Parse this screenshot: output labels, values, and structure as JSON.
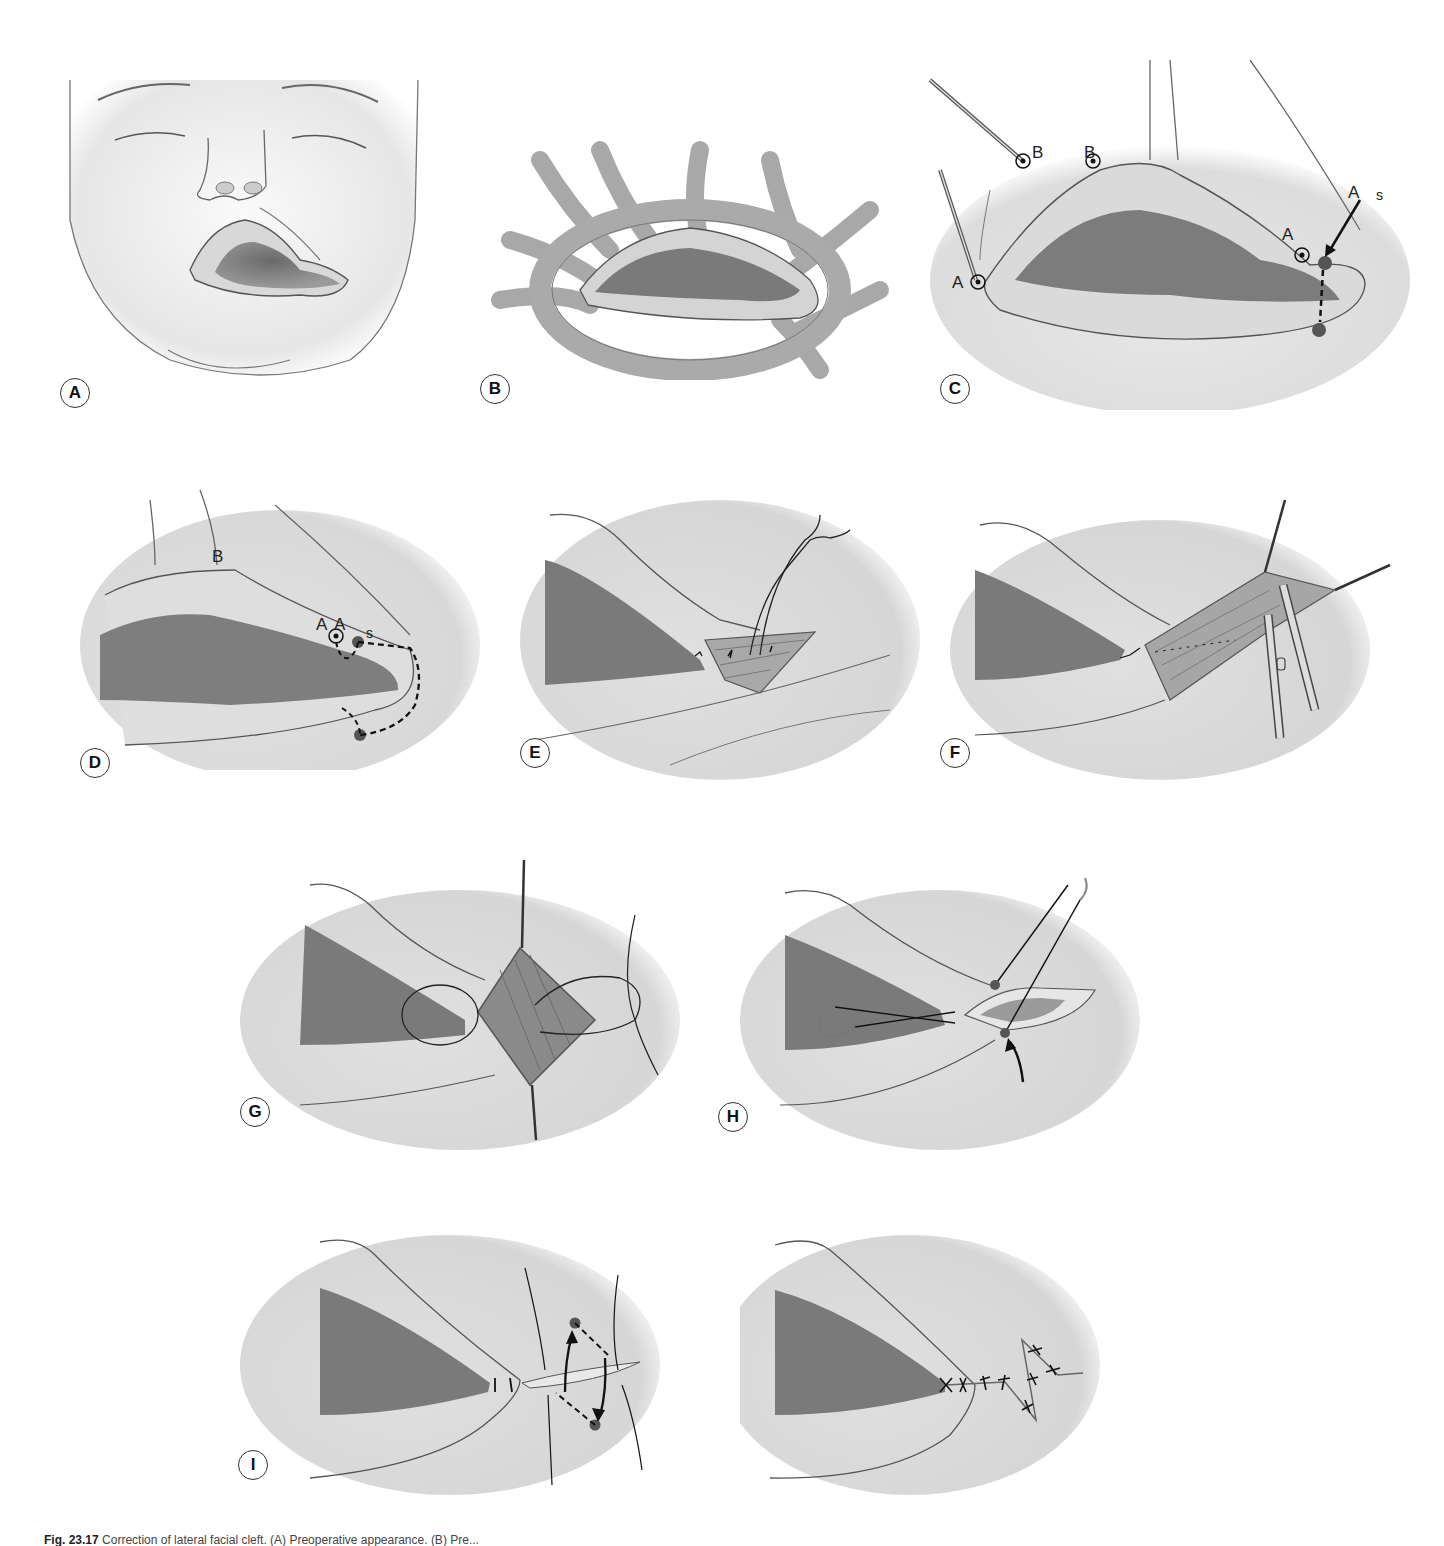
{
  "figure": {
    "number": "Fig. 23.17",
    "caption_text": "Correction of lateral facial cleft. (A) Preoperative appearance. (B) Pre...",
    "panels": [
      {
        "id": "A",
        "label": "A",
        "description": "Infant face with left lateral facial cleft (macrostomia), enlarged mouth commissure"
      },
      {
        "id": "B",
        "label": "B",
        "description": "Orbicularis oris muscle fibres around widened mouth"
      },
      {
        "id": "C",
        "label": "C",
        "description": "Markings with skin hooks at points A and B; point s and dashed vertical line at new commissure",
        "point_labels": [
          "A",
          "B",
          "B",
          "A",
          "A",
          "s"
        ]
      },
      {
        "id": "D",
        "label": "D",
        "description": "Incision design with dashed line around lateral cleft",
        "point_labels": [
          "B",
          "A",
          "A",
          "s"
        ]
      },
      {
        "id": "E",
        "label": "E",
        "description": "Mucosal closure with sutures and needle"
      },
      {
        "id": "F",
        "label": "F",
        "description": "Muscle dissection with scissors and retracting hooks"
      },
      {
        "id": "G",
        "label": "G",
        "description": "Orbicularis muscle overlap suture"
      },
      {
        "id": "H",
        "label": "H",
        "description": "Commissure vermilion suture with needle; curved arrow"
      },
      {
        "id": "I",
        "label": "I",
        "description": "Z-plasty design with dashed limbs and transposition arrows"
      },
      {
        "id": "J",
        "label": "",
        "description": "Final closure with Z-plasty sutures"
      }
    ]
  }
}
